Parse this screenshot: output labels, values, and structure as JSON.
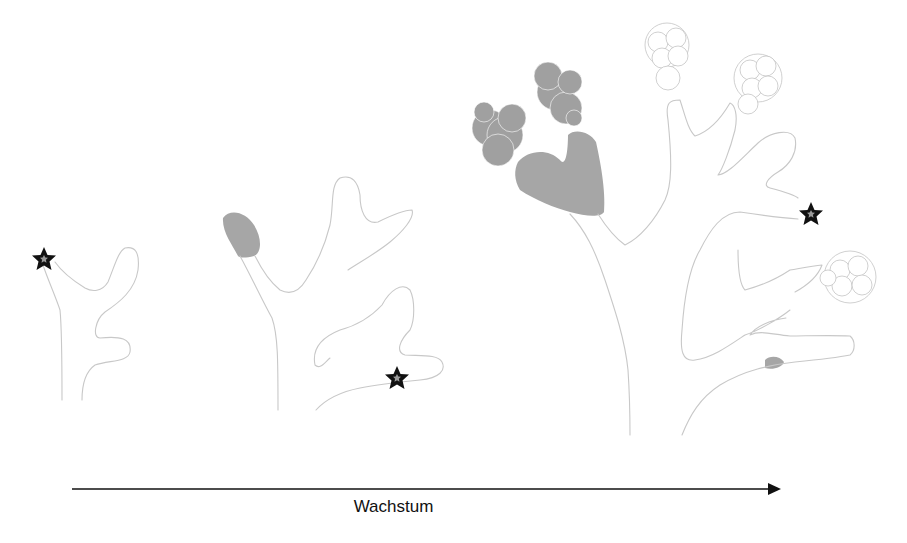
{
  "diagram": {
    "type": "growth-stages",
    "stages": [
      {
        "id": "stage-1",
        "description": "small branching structure with star marker at tip"
      },
      {
        "id": "stage-2",
        "description": "branching structure with gray filled tip and star marker"
      },
      {
        "id": "stage-3",
        "description": "large branching structure with gray filled cell clusters, open cell clusters, star marker and small gray tip"
      }
    ],
    "arrow": {
      "label": "Wachstum",
      "direction": "right"
    },
    "colors": {
      "outline": "#c8c8c8",
      "filled": "#a6a6a6",
      "star": "#111111",
      "star_center": "#999999",
      "arrow": "#111111"
    }
  }
}
